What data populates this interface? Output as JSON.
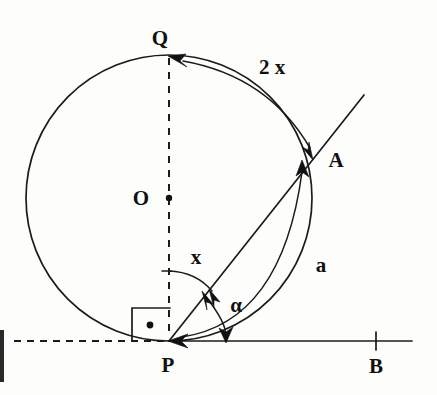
{
  "figure": {
    "kind": "geometry-diagram",
    "background_color": "#fdfdfc",
    "ink_color": "#1b1b1b"
  },
  "labels": {
    "center": "O",
    "top_point": "Q",
    "circle_point": "A",
    "tangent_point": "P",
    "axis_point": "B",
    "arc_major": "2 x",
    "arc_minor": "a",
    "angle_inscribed": "x",
    "angle_tangent_chord": "α"
  },
  "geometry": {
    "circle": {
      "cx": 169,
      "cy": 198,
      "r": 143
    },
    "points": {
      "O": {
        "x": 169,
        "y": 198
      },
      "Q": {
        "x": 169,
        "y": 55
      },
      "P": {
        "x": 169,
        "y": 341
      },
      "A": {
        "x": 310,
        "y": 159
      },
      "B_tick": {
        "x": 376,
        "y": 341
      }
    },
    "tangent_line": {
      "x1": 14,
      "y1": 341,
      "x2": 412,
      "y2": 341
    },
    "chord_line": {
      "x1": 169,
      "y1": 341,
      "x2": 364,
      "y2": 95
    },
    "diameter_dashed": {
      "x1": 169,
      "y1": 55,
      "x2": 169,
      "y2": 341
    },
    "right_angle_box": {
      "x": 132,
      "y": 308,
      "w": 38,
      "h": 33
    }
  },
  "label_positions": {
    "O": {
      "x": 141,
      "y": 197
    },
    "Q": {
      "x": 160,
      "y": 45
    },
    "A": {
      "x": 330,
      "y": 166
    },
    "P": {
      "x": 161,
      "y": 368
    },
    "B": {
      "x": 368,
      "y": 370
    },
    "arc_major": {
      "x": 251,
      "y": 73
    },
    "arc_minor": {
      "x": 314,
      "y": 272
    },
    "angle_x": {
      "x": 189,
      "y": 264
    },
    "angle_alpha": {
      "x": 227,
      "y": 311
    }
  },
  "annotations": {
    "arc_major_note": "Arc from A counterclockwise over the top to Q, labelled 2 x, arrow pointing to Q and to A",
    "arc_minor_note": "Arc from P to A along the circle, labelled a, arrowhead at A",
    "angle_x_note": "Angle between dashed diameter PQ and chord PA at P, labelled x",
    "angle_alpha_note": "Angle between chord PA and tangent line PB at P, labelled alpha, double arrowheads",
    "right_angle_note": "Right angle square with dot at tangent point P"
  }
}
